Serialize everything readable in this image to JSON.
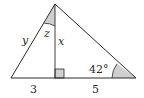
{
  "diagram": {
    "type": "geometry-triangle",
    "labels": {
      "hypotenuse_left": "y",
      "apex_angle": "z",
      "altitude": "x",
      "angle_right": "42°",
      "base_left": "3",
      "base_right": "5"
    },
    "colors": {
      "stroke": "#2a2a2a",
      "shade": "#cfcfcf"
    }
  }
}
